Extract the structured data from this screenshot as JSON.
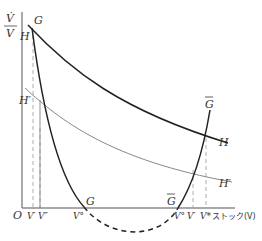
{
  "diagram": {
    "y_axis_label_numerator": "V̇",
    "y_axis_label_denominator": "V",
    "x_axis_label": "ストック(V)",
    "origin_label": "O",
    "curves": {
      "G": {
        "label_top": "G",
        "label_bottom": "G"
      },
      "G_bar": {
        "label_top": "G",
        "label_bottom": "G"
      },
      "H": {
        "label_left": "H",
        "label_right": "H"
      },
      "H_prime": {
        "label_left": "H′",
        "label_right": "H′"
      }
    },
    "x_ticks": [
      {
        "label": "V′",
        "x": 34
      },
      {
        "label": "V″",
        "x": 42
      },
      {
        "label": "V°",
        "x": 80
      },
      {
        "label": "V°",
        "x": 184
      },
      {
        "label": "V′",
        "x": 196
      },
      {
        "label": "V*",
        "x": 208
      }
    ],
    "colors": {
      "axis": "#666666",
      "thick_curve": "#222222",
      "thin_curve": "#888888",
      "dashed": "#999999"
    }
  }
}
